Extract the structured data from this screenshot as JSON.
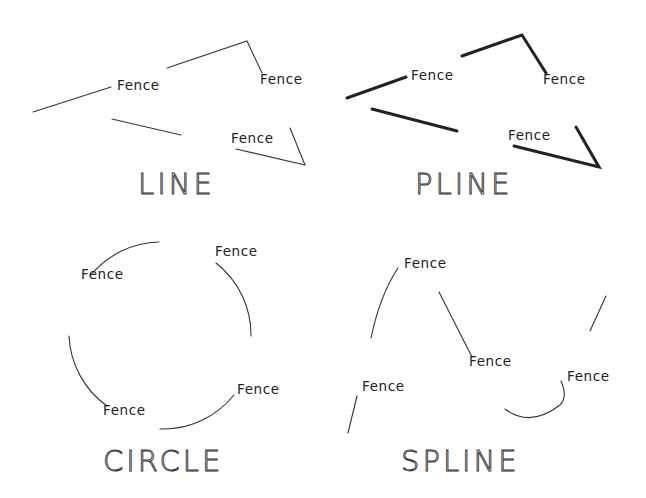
{
  "diagram": {
    "panels": [
      {
        "id": "line",
        "title": "LINE",
        "title_pos": [
          138,
          194
        ],
        "stroke": "thin",
        "segments": [
          "M33,112 L111,87",
          "M167,68 L247,41 L262,73",
          "M112,119 L181,135",
          "M236,149 L305,165 L290,128"
        ],
        "labels": [
          {
            "text": "Fence",
            "x": 117,
            "y": 90
          },
          {
            "text": "Fence",
            "x": 260,
            "y": 84
          },
          {
            "text": "Fence",
            "x": 231,
            "y": 143
          }
        ]
      },
      {
        "id": "pline",
        "title": "PLINE",
        "title_pos": [
          415,
          194
        ],
        "stroke": "thick",
        "segments": [
          "M347,98 L406,77",
          "M462,56 L522,35 L546,73",
          "M372,109 L457,131",
          "M514,146 L599,167 L576,127"
        ],
        "labels": [
          {
            "text": "Fence",
            "x": 411,
            "y": 80
          },
          {
            "text": "Fence",
            "x": 543,
            "y": 84
          },
          {
            "text": "Fence",
            "x": 508,
            "y": 140
          }
        ]
      },
      {
        "id": "circle",
        "title": "CIRCLE",
        "title_pos": [
          103,
          471
        ],
        "stroke": "thin",
        "segments": [
          "M159,242 A91,91 0 0 0 91,275",
          "M216,263 A91,91 0 0 1 251,336",
          "M234,395 A91,91 0 0 1 160,429",
          "M69,336 A91,91 0 0 0 107,406"
        ],
        "labels": [
          {
            "text": "Fence",
            "x": 81,
            "y": 279
          },
          {
            "text": "Fence",
            "x": 215,
            "y": 256
          },
          {
            "text": "Fence",
            "x": 237,
            "y": 394
          },
          {
            "text": "Fence",
            "x": 103,
            "y": 415
          }
        ]
      },
      {
        "id": "spline",
        "title": "SPLINE",
        "title_pos": [
          401,
          471
        ],
        "stroke": "thin",
        "segments": [
          "M371,338 Q380,295 398,268",
          "M439,292 L472,357",
          "M606,296 L590,331",
          "M357,396 L348,433",
          "M505,409 Q530,428 560,405 Q568,397 561,381"
        ],
        "labels": [
          {
            "text": "Fence",
            "x": 404,
            "y": 268
          },
          {
            "text": "Fence",
            "x": 469,
            "y": 366
          },
          {
            "text": "Fence",
            "x": 567,
            "y": 381
          },
          {
            "text": "Fence",
            "x": 362,
            "y": 391
          }
        ]
      }
    ],
    "colors": {
      "background": "#ffffff",
      "line": "#333333",
      "text": "#222222"
    }
  }
}
